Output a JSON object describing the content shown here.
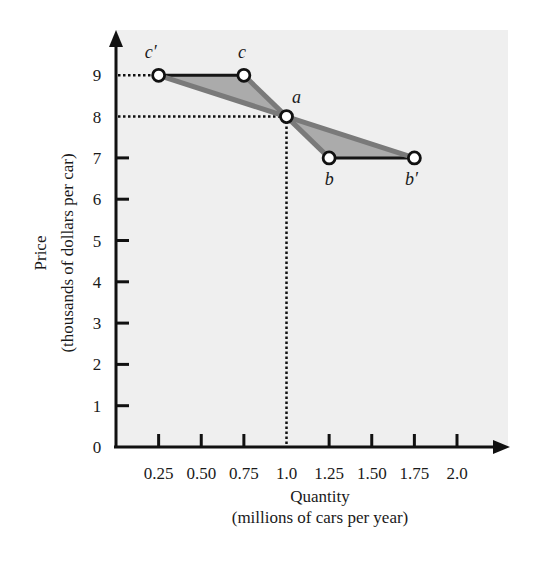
{
  "chart_data": {
    "type": "line",
    "title": "",
    "xlabel": "Quantity",
    "xlabel_sub": "(millions of cars per year)",
    "ylabel": "Price",
    "ylabel_sub": "(thousands of dollars per car)",
    "xlim": [
      0,
      2.0
    ],
    "ylim": [
      0,
      9
    ],
    "x_ticks": [
      0.25,
      0.5,
      0.75,
      1.0,
      1.25,
      1.5,
      1.75,
      2.0
    ],
    "x_tick_labels": [
      "0.25",
      "0.50",
      "0.75",
      "1.0",
      "1.25",
      "1.50",
      "1.75",
      "2.0"
    ],
    "y_ticks": [
      0,
      1,
      2,
      3,
      4,
      5,
      6,
      7,
      8,
      9
    ],
    "y_tick_labels": [
      "0",
      "1",
      "2",
      "3",
      "4",
      "5",
      "6",
      "7",
      "8",
      "9"
    ],
    "grid": false,
    "legend": null,
    "points": [
      {
        "label": "c′",
        "x": 0.25,
        "y": 9
      },
      {
        "label": "c",
        "x": 0.75,
        "y": 9
      },
      {
        "label": "a",
        "x": 1.0,
        "y": 8
      },
      {
        "label": "b",
        "x": 1.25,
        "y": 7
      },
      {
        "label": "b′",
        "x": 1.75,
        "y": 7
      }
    ],
    "series": [
      {
        "name": "steeper demand (c–a–b)",
        "x": [
          0.75,
          1.0,
          1.25
        ],
        "y": [
          9,
          8,
          7
        ]
      },
      {
        "name": "flatter demand (c′–a–b′)",
        "x": [
          0.25,
          1.0,
          1.75
        ],
        "y": [
          9,
          8,
          7
        ]
      }
    ],
    "segments": [
      {
        "name": "c′ to c",
        "from": [
          0.25,
          9
        ],
        "to": [
          0.75,
          9
        ]
      },
      {
        "name": "b to b′",
        "from": [
          1.25,
          7
        ],
        "to": [
          1.75,
          7
        ]
      }
    ],
    "shaded_regions": [
      {
        "name": "upper triangle",
        "vertices": [
          [
            0.25,
            9
          ],
          [
            0.75,
            9
          ],
          [
            1.0,
            8
          ]
        ]
      },
      {
        "name": "lower triangle",
        "vertices": [
          [
            1.0,
            8
          ],
          [
            1.25,
            7
          ],
          [
            1.75,
            7
          ]
        ]
      }
    ],
    "reference_lines": [
      {
        "type": "horizontal-dotted",
        "y": 9,
        "x_to": 0.25
      },
      {
        "type": "horizontal-dotted",
        "y": 8,
        "x_to": 1.0
      },
      {
        "type": "vertical-dotted",
        "x": 1.0,
        "y_to": 8
      }
    ]
  },
  "colors": {
    "panel": "#efefef",
    "axis": "#111111",
    "curve": "#7a7a7a",
    "fill": "#ababab",
    "segment": "#151515"
  }
}
